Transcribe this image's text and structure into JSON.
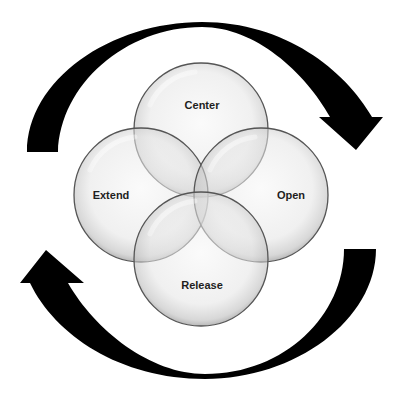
{
  "diagram": {
    "type": "cycle-venn",
    "circles": [
      {
        "label": "Center",
        "cx": 201,
        "cy": 130,
        "r": 67,
        "label_x": 202,
        "label_y": 109
      },
      {
        "label": "Extend",
        "cx": 141,
        "cy": 195,
        "r": 67,
        "label_x": 111,
        "label_y": 199
      },
      {
        "label": "Open",
        "cx": 261,
        "cy": 195,
        "r": 67,
        "label_x": 291,
        "label_y": 199
      },
      {
        "label": "Release",
        "cx": 201,
        "cy": 259,
        "r": 67,
        "label_x": 202,
        "label_y": 289
      }
    ],
    "arrows": [
      {
        "name": "top-arrow",
        "direction": "clockwise",
        "from": "left",
        "to": "right"
      },
      {
        "name": "bottom-arrow",
        "direction": "clockwise",
        "from": "right",
        "to": "left"
      }
    ],
    "colors": {
      "background": "#ffffff",
      "arrow": "#000000",
      "circle_fill_light": "#f4f4f4",
      "circle_fill_dark": "#c8c8c8",
      "circle_stroke": "#555555",
      "label": "#1e1e1e"
    }
  }
}
